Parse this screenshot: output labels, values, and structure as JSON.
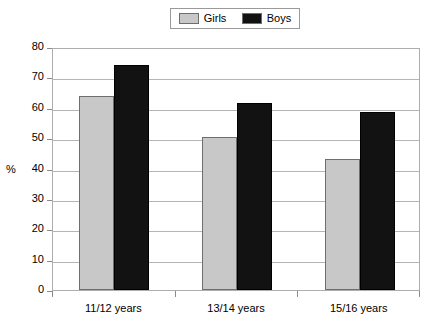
{
  "legend": {
    "position": "top-center",
    "entries": [
      {
        "label": "Girls",
        "color": "#c8c8c8"
      },
      {
        "label": "Boys",
        "color": "#121212"
      }
    ]
  },
  "axes": {
    "ylabel": "%",
    "xlabel": "",
    "yticks": [
      "0",
      "10",
      "20",
      "30",
      "40",
      "50",
      "60",
      "70",
      "80"
    ]
  },
  "chart_data": {
    "type": "bar",
    "title": "",
    "xlabel": "",
    "ylabel": "%",
    "ylim": [
      0,
      80
    ],
    "ytick_step": 10,
    "grid": true,
    "legend_position": "top-center",
    "categories": [
      "11/12 years",
      "13/14 years",
      "15/16 years"
    ],
    "series": [
      {
        "name": "Girls",
        "color": "#c8c8c8",
        "values": [
          64,
          50.5,
          43
        ]
      },
      {
        "name": "Boys",
        "color": "#121212",
        "values": [
          74,
          61.5,
          58.5
        ]
      }
    ]
  }
}
